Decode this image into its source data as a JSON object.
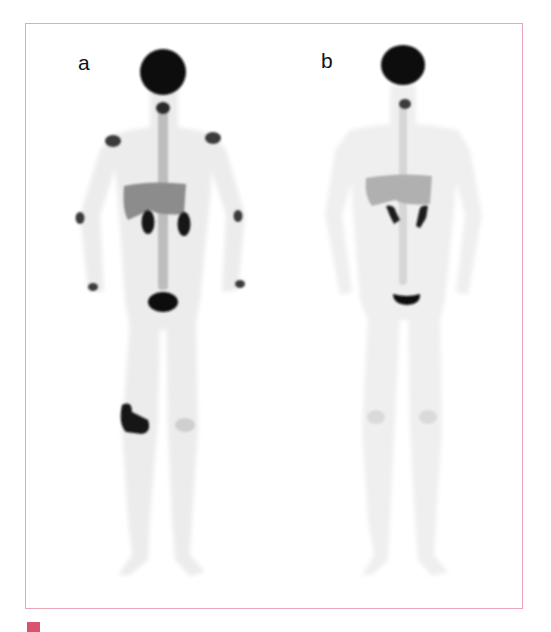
{
  "figure": {
    "border_color": "#e8a6b8",
    "panels": [
      {
        "id": "a",
        "label": "a",
        "description": "Whole-body PET MIP, anterior view, with intense uptake at brain, kidneys, bladder, joints and a lesion near the right knee"
      },
      {
        "id": "b",
        "label": "b",
        "description": "Whole-body PET MIP, anterior view, with physiological uptake at brain, kidneys and bladder"
      }
    ]
  },
  "caption": {
    "marker_color": "#d9536f",
    "text": ""
  }
}
